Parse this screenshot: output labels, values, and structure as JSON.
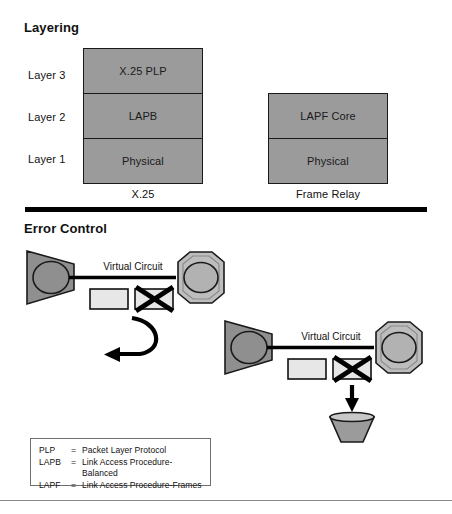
{
  "figure": {
    "sections": [
      {
        "id": "layering",
        "title": "Layering"
      },
      {
        "id": "error_control",
        "title": "Error Control"
      }
    ]
  },
  "layering": {
    "title": "Layering",
    "row_labels": [
      "Layer 3",
      "Layer 2",
      "Layer 1"
    ],
    "stacks": [
      {
        "caption": "X.25",
        "cells": [
          "X.25 PLP",
          "LAPB",
          "Physical"
        ]
      },
      {
        "caption": "Frame Relay",
        "cells": [
          "LAPF Core",
          "Physical"
        ]
      }
    ]
  },
  "error_control": {
    "title": "Error Control",
    "diagrams": [
      {
        "id": "x25-error-control",
        "source_node_label": "X.25",
        "dest_node_label": "X.25",
        "link_label": "Virtual Circuit",
        "frames": [
          "",
          "X"
        ],
        "outcome": "retransmit-loop-arrow"
      },
      {
        "id": "fr-error-control",
        "source_node_label": "FR",
        "dest_node_label": "FR",
        "link_label": "Virtual Circuit",
        "frames": [
          "",
          "X"
        ],
        "outcome": "discard-arrow-to-bin"
      }
    ]
  },
  "legend": {
    "rows": [
      {
        "key": "PLP",
        "eq": "=",
        "value": "Packet Layer Protocol"
      },
      {
        "key": "LAPB",
        "eq": "=",
        "value": "Link Access Procedure-Balanced"
      },
      {
        "key": "LAPF",
        "eq": "=",
        "value": "Link Access Procedure-Frames"
      }
    ]
  },
  "colors": {
    "node_fill": "#8f8f8f",
    "stack_fill": "#9b9b9b",
    "frame_fill": "#e4e4e4",
    "outline": "#1a1a1a",
    "rule": "#000000",
    "thin_rule": "#8a8a8a"
  }
}
